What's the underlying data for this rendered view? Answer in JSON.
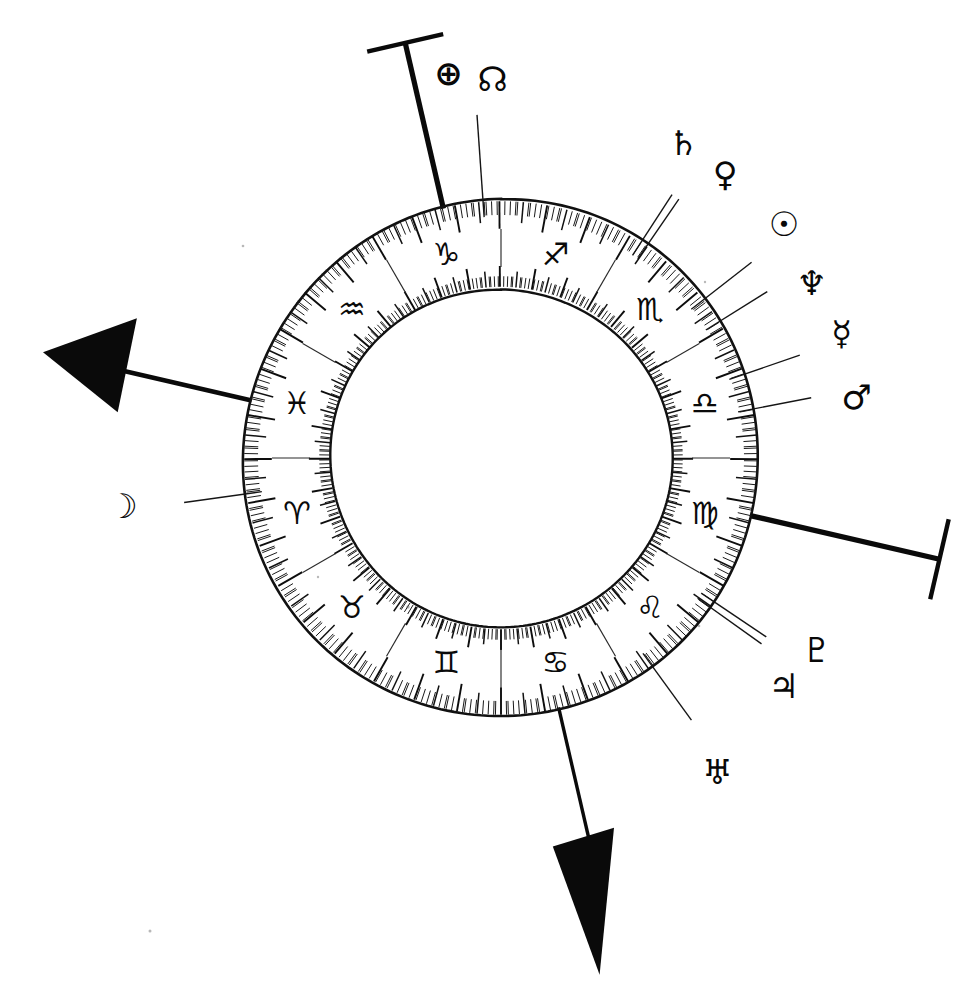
{
  "diagram": {
    "title": "Astrological Natal Chart Wheel",
    "kind": "zodiac-wheel",
    "background_color": "#ffffff",
    "ink_color": "#0a0a0a",
    "geometry": {
      "center_x": 501,
      "center_y": 458,
      "outer_radius": 258,
      "mid_radius": 228,
      "inner_radius": 170,
      "tick_band_outer": 30,
      "tick_band_inner": 22,
      "degrees_per_sign": 30,
      "total_degrees": 360,
      "zero_point_note": "Capricorn / Sagittarius cusp at top (12 o'clock), signs run clockwise"
    },
    "zodiac_signs": [
      {
        "name": "Sagittarius",
        "glyph": "♐",
        "index": 0,
        "start_deg": 0,
        "center_deg": 15,
        "label_angle_deg": 15
      },
      {
        "name": "Scorpio",
        "glyph": "♏",
        "index": 1,
        "start_deg": 30,
        "center_deg": 45,
        "label_angle_deg": 45
      },
      {
        "name": "Libra",
        "glyph": "♎",
        "index": 2,
        "start_deg": 60,
        "center_deg": 75,
        "label_angle_deg": 75
      },
      {
        "name": "Virgo",
        "glyph": "♍",
        "index": 3,
        "start_deg": 90,
        "center_deg": 105,
        "label_angle_deg": 105
      },
      {
        "name": "Leo",
        "glyph": "♌",
        "index": 4,
        "start_deg": 120,
        "center_deg": 135,
        "label_angle_deg": 135
      },
      {
        "name": "Cancer",
        "glyph": "♋",
        "index": 5,
        "start_deg": 150,
        "center_deg": 165,
        "label_angle_deg": 165
      },
      {
        "name": "Gemini",
        "glyph": "♊",
        "index": 6,
        "start_deg": 180,
        "center_deg": 195,
        "label_angle_deg": 195
      },
      {
        "name": "Taurus",
        "glyph": "♉",
        "index": 7,
        "start_deg": 210,
        "center_deg": 225,
        "label_angle_deg": 225
      },
      {
        "name": "Aries",
        "glyph": "♈",
        "index": 8,
        "start_deg": 240,
        "center_deg": 255,
        "label_angle_deg": 255
      },
      {
        "name": "Pisces",
        "glyph": "♓",
        "index": 9,
        "start_deg": 270,
        "center_deg": 285,
        "label_angle_deg": 285
      },
      {
        "name": "Aquarius",
        "glyph": "♒",
        "index": 10,
        "start_deg": 300,
        "center_deg": 315,
        "label_angle_deg": 315
      },
      {
        "name": "Capricorn",
        "glyph": "♑",
        "index": 11,
        "start_deg": 330,
        "center_deg": 345,
        "label_angle_deg": 345
      }
    ],
    "planets": [
      {
        "name": "Part of Fortune",
        "glyph": "⊕",
        "icon_name": "fortune-icon",
        "wheel_angle_deg": 356,
        "pointer_length": 86,
        "label_radius": 122,
        "label_dx": -26,
        "label_dy": -6
      },
      {
        "name": "North Node",
        "glyph": "☊",
        "icon_name": "north-node-icon",
        "wheel_angle_deg": 356,
        "pointer_length": 0,
        "label_radius": 122,
        "label_dx": 18,
        "label_dy": 0
      },
      {
        "name": "Saturn",
        "glyph": "♄",
        "icon_name": "saturn-icon",
        "wheel_angle_deg": 33,
        "pointer_length": 56,
        "label_radius": 92,
        "label_dx": -8,
        "label_dy": -22
      },
      {
        "name": "Venus",
        "glyph": "♀",
        "icon_name": "venus-icon",
        "wheel_angle_deg": 34.5,
        "pointer_length": 56,
        "label_radius": 92,
        "label_dx": 26,
        "label_dy": 4
      },
      {
        "name": "Sun",
        "glyph": "☉",
        "icon_name": "sun-icon",
        "wheel_angle_deg": 52,
        "pointer_length": 60,
        "label_radius": 96,
        "label_dx": 4,
        "label_dy": -16
      },
      {
        "name": "Neptune",
        "glyph": "♆",
        "icon_name": "neptune-icon",
        "wheel_angle_deg": 58,
        "pointer_length": 56,
        "label_radius": 92,
        "label_dx": 14,
        "label_dy": 10
      },
      {
        "name": "Mercury",
        "glyph": "☿",
        "icon_name": "mercury-icon",
        "wheel_angle_deg": 71,
        "pointer_length": 58,
        "label_radius": 94,
        "label_dx": 8,
        "label_dy": -10
      },
      {
        "name": "Mars",
        "glyph": "♂",
        "icon_name": "mars-icon",
        "wheel_angle_deg": 79,
        "pointer_length": 58,
        "label_radius": 94,
        "label_dx": 10,
        "label_dy": 6
      },
      {
        "name": "Pluto",
        "glyph": "♇",
        "icon_name": "pluto-icon",
        "wheel_angle_deg": 124,
        "pointer_length": 62,
        "label_radius": 104,
        "label_dx": 16,
        "label_dy": -10
      },
      {
        "name": "Jupiter",
        "glyph": "♃",
        "icon_name": "jupiter-icon",
        "wheel_angle_deg": 125.5,
        "pointer_length": 62,
        "label_radius": 104,
        "label_dx": -12,
        "label_dy": 18
      },
      {
        "name": "Uranus",
        "glyph": "♅",
        "icon_name": "uranus-icon",
        "wheel_angle_deg": 144,
        "pointer_length": 66,
        "label_radius": 100,
        "label_dx": 6,
        "label_dy": 24
      },
      {
        "name": "Moon",
        "glyph": "☽",
        "icon_name": "moon-icon",
        "wheel_angle_deg": 262,
        "pointer_length": 62,
        "label_radius": 102,
        "label_dx": -22,
        "label_dy": -2
      }
    ],
    "axes": [
      {
        "name": "Ascendant",
        "short": "ASC",
        "marker_type": "arrowhead",
        "wheel_angle_deg": 283,
        "shaft_length": 212,
        "note": "Bold arrow pointing outward to the left"
      },
      {
        "name": "Midheaven",
        "short": "MC",
        "marker_type": "t-bar",
        "wheel_angle_deg": 347,
        "shaft_length": 168,
        "cap_length": 78,
        "note": "Bold line with perpendicular cap at top-left"
      },
      {
        "name": "Descendant",
        "short": "DSC",
        "marker_type": "t-bar",
        "wheel_angle_deg": 103,
        "shaft_length": 192,
        "cap_length": 82,
        "note": "Bold line with perpendicular cap at right"
      },
      {
        "name": "Imum Coeli",
        "short": "IC",
        "marker_type": "spike",
        "wheel_angle_deg": 167,
        "shaft_length": 268,
        "note": "Bold tapered spike pointing down-right"
      }
    ]
  }
}
